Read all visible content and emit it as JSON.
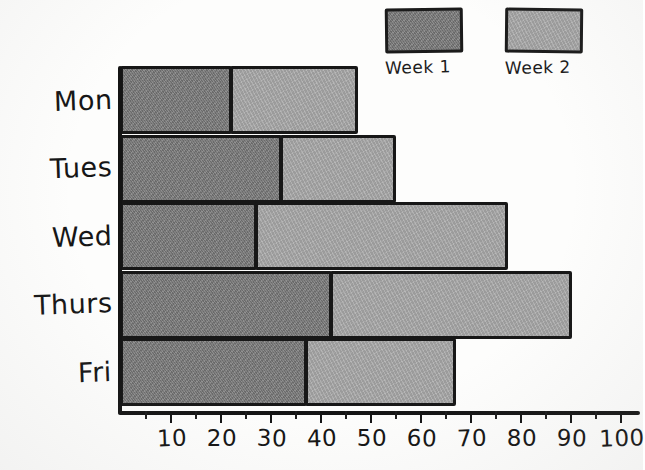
{
  "chart_data": {
    "type": "bar",
    "orientation": "horizontal",
    "stacked": true,
    "title": "",
    "subtitle": "",
    "xlabel": "",
    "ylabel": "",
    "categories": [
      "Mon",
      "Tues",
      "Wed",
      "Thurs",
      "Fri"
    ],
    "series": [
      {
        "name": "Week 1",
        "color": "#7b7b7b",
        "values": [
          22,
          32,
          27,
          42,
          37
        ]
      },
      {
        "name": "Week 2",
        "color": "#a9a9a9",
        "values": [
          25,
          23,
          50,
          48,
          30
        ]
      }
    ],
    "totals": [
      47,
      55,
      77,
      90,
      67
    ],
    "xlim": [
      0,
      100
    ],
    "x_tick_labels": [
      "10",
      "20",
      "30",
      "40",
      "50",
      "60",
      "70",
      "80",
      "90",
      "100"
    ],
    "x_tick_values": [
      10,
      20,
      30,
      40,
      50,
      60,
      70,
      80,
      90,
      100
    ],
    "x_minor_tick_step": 5,
    "grid": false,
    "legend_position": "top-right",
    "style": "hand-drawn"
  },
  "legend": {
    "entries": [
      {
        "label": "Week 1",
        "color": "#7b7b7b"
      },
      {
        "label": "Week 2",
        "color": "#a9a9a9"
      }
    ]
  },
  "colors": {
    "week1": "#7b7b7b",
    "week2": "#a9a9a9",
    "ink": "#141414",
    "paper": "#fdfdfc"
  }
}
